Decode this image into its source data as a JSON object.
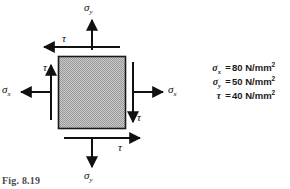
{
  "figure": {
    "caption": "Fig. 8.19",
    "element": {
      "shape": "square",
      "fill": "stippled-gray",
      "fill_color": "#b3b3b3",
      "border_color": "#1a1a1a"
    },
    "labels": {
      "sigma_y_top": "σ",
      "sigma_y_top_sub": "y",
      "sigma_y_bottom": "σ",
      "sigma_y_bottom_sub": "y",
      "sigma_x_left": "σ",
      "sigma_x_left_sub": "x",
      "sigma_x_right": "σ",
      "sigma_x_right_sub": "x",
      "tau_top": "τ",
      "tau_left": "τ",
      "tau_right": "τ",
      "tau_bottom": "τ"
    },
    "arrows": [
      {
        "name": "sigma-y-top-arrow",
        "direction": "up",
        "label": "σy"
      },
      {
        "name": "sigma-y-bottom-arrow",
        "direction": "down",
        "label": "σy"
      },
      {
        "name": "sigma-x-left-arrow",
        "direction": "left",
        "label": "σx"
      },
      {
        "name": "sigma-x-right-arrow",
        "direction": "right",
        "label": "σx"
      },
      {
        "name": "tau-top-arrow",
        "direction": "left",
        "label": "τ"
      },
      {
        "name": "tau-bottom-arrow",
        "direction": "right",
        "label": "τ"
      },
      {
        "name": "tau-left-arrow",
        "direction": "up",
        "label": "τ"
      },
      {
        "name": "tau-right-arrow",
        "direction": "down",
        "label": "τ"
      }
    ]
  },
  "legend": {
    "rows": [
      {
        "symbol": "σ",
        "subscript": "x",
        "equals": "=",
        "value": "80 N/mm",
        "exponent": "2"
      },
      {
        "symbol": "σ",
        "subscript": "y",
        "equals": "=",
        "value": "50 N/mm",
        "exponent": "2"
      },
      {
        "symbol": "τ",
        "subscript": "",
        "equals": "=",
        "value": "40 N/mm",
        "exponent": "2"
      }
    ]
  }
}
